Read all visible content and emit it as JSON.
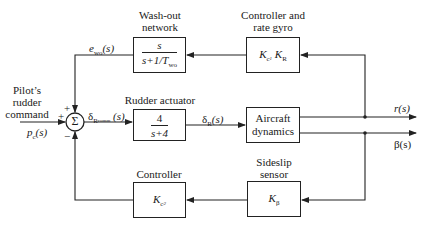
{
  "diagram": {
    "type": "block-diagram",
    "blocks": {
      "washout": {
        "title_line1": "Wash-out",
        "title_line2": "network",
        "num": "s",
        "den": "s+1/T",
        "den_sub": "wo"
      },
      "rate_gyro": {
        "title_line1": "Controller and",
        "title_line2": "rate gyro",
        "gain_k": "K",
        "gain_k_sub": "c",
        "gain_k_sub2": "1",
        "gain_r": "K",
        "gain_r_sub": "R"
      },
      "actuator": {
        "title": "Rudder actuator",
        "num": "4",
        "den": "s+4"
      },
      "aircraft": {
        "line1": "Aircraft",
        "line2": "dynamics"
      },
      "sideslip": {
        "title_line1": "Sideslip",
        "title_line2": "sensor",
        "gain": "K",
        "gain_sub": "β"
      },
      "controller": {
        "title": "Controller",
        "gain": "K",
        "gain_sub": "c",
        "gain_sub2": "2"
      }
    },
    "summing_junction": {
      "symbol": "Σ",
      "sign_top": "+",
      "sign_left": "+",
      "sign_bottom": "−"
    },
    "signals": {
      "input_label_line1": "Pilot’s",
      "input_label_line2": "rudder",
      "input_label_line3": "command",
      "input": "p",
      "input_sub": "c",
      "input_arg": "(s)",
      "washout_out": "e",
      "washout_out_sub": "wo",
      "washout_out_arg": "(s)",
      "delta_comm": "δ",
      "delta_comm_sub": "R",
      "delta_comm_sub2": "comm",
      "delta_comm_arg": "(s)",
      "delta_r": "δ",
      "delta_r_sub": "R",
      "delta_r_arg": "(s)",
      "yaw_rate": "r(s)",
      "sideslip": "β(s)"
    }
  }
}
